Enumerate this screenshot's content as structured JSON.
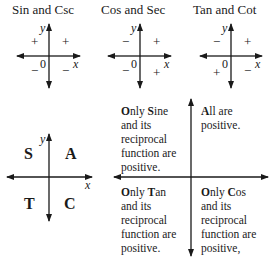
{
  "graphs": [
    {
      "title": "Sin and Csc",
      "x_label": "x",
      "y_label": "y",
      "origin_label": "0",
      "quadrant_signs": {
        "q1": "+",
        "q2": "+",
        "q3": "−",
        "q4": "−"
      }
    },
    {
      "title": "Cos and Sec",
      "x_label": "x",
      "y_label": "y",
      "origin_label": "0",
      "quadrant_signs": {
        "q1": "+",
        "q2": "−",
        "q3": "−",
        "q4": "+"
      }
    },
    {
      "title": "Tan and Cot",
      "x_label": "x",
      "y_label": "y",
      "origin_label": "0",
      "quadrant_signs": {
        "q1": "+",
        "q2": "−",
        "q3": "+",
        "q4": "−"
      }
    }
  ],
  "astc": {
    "x_label": "x",
    "y_label": "y",
    "q1": "A",
    "q2": "S",
    "q3": "T",
    "q4": "C"
  },
  "explanation": {
    "q2": {
      "first_letter": "O",
      "first_rest": "nly ",
      "key_letter": "S",
      "key_rest": "ine",
      "rest": "and its\nreciprocal\nfunction are\npositive."
    },
    "q1": {
      "first_letter": "A",
      "first_rest": "ll are",
      "rest": "positive."
    },
    "q3": {
      "first_letter": "O",
      "first_rest": "nly ",
      "key_letter": "T",
      "key_rest": "an",
      "rest": "and its\nreciprocal\nfunction are\npositive."
    },
    "q4": {
      "first_letter": "O",
      "first_rest": "nly ",
      "key_letter": "C",
      "key_rest": "os",
      "rest": "and its\nreciprocal\nfunction are\npositive,"
    }
  }
}
